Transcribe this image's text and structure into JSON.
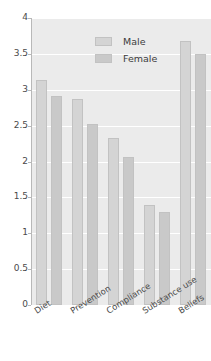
{
  "chart_data": {
    "type": "bar",
    "title": "",
    "xlabel": "",
    "ylabel": "",
    "ylim": [
      0,
      4
    ],
    "grid": true,
    "legend_position": "top-center",
    "categories": [
      "Diet",
      "Prevention",
      "Compliance",
      "Substance use",
      "Beliefs"
    ],
    "ytick_labels": [
      "0",
      "0.5",
      "1",
      "1.5",
      "2",
      "2.5",
      "3",
      "3.5",
      "4"
    ],
    "ytick_values": [
      0,
      0.5,
      1,
      1.5,
      2,
      2.5,
      3,
      3.5,
      4
    ],
    "series": [
      {
        "name": "Male",
        "color": "#d4d4d4",
        "values": [
          3.14,
          2.87,
          2.33,
          1.39,
          3.68
        ]
      },
      {
        "name": "Female",
        "color": "#c9c9c9",
        "values": [
          2.92,
          2.52,
          2.06,
          1.3,
          3.5
        ]
      }
    ]
  },
  "legend": {
    "items": [
      {
        "label": "Male"
      },
      {
        "label": "Female"
      }
    ]
  },
  "colors": {
    "plot_background": "#ebebeb",
    "gridline": "#ffffff",
    "axis": "#b8b8b8",
    "male_bar": "#d4d4d4",
    "female_bar": "#c9c9c9",
    "bar_border": "#c2c2c2",
    "tick_text": "#4a4a4a"
  }
}
